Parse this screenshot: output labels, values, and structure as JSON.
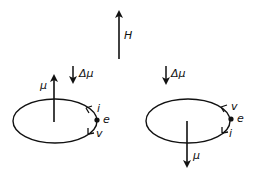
{
  "diagram": {
    "field": {
      "label": "H"
    },
    "left_orbit": {
      "delta_mu_label": "Δμ",
      "mu_label": "μ",
      "electron_label": "e",
      "current_label": "i",
      "velocity_label": "v",
      "mu_direction": "up"
    },
    "right_orbit": {
      "delta_mu_label": "Δμ",
      "mu_label": "μ",
      "electron_label": "e",
      "current_label": "i",
      "velocity_label": "v",
      "mu_direction": "down"
    },
    "colors": {
      "stroke": "#111111",
      "background": "#ffffff"
    }
  }
}
